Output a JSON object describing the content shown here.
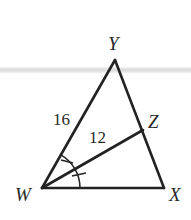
{
  "figure": {
    "type": "triangle-angle-bisector",
    "vertices": {
      "Y": {
        "label": "Y",
        "x": 115,
        "y": 60
      },
      "W": {
        "label": "W",
        "x": 42,
        "y": 188
      },
      "X": {
        "label": "X",
        "x": 164,
        "y": 188
      },
      "Z": {
        "label": "Z",
        "x": 143,
        "y": 130
      }
    },
    "segments": [
      {
        "from": "W",
        "to": "Y",
        "length_label": "16"
      },
      {
        "from": "Y",
        "to": "X",
        "length_label": ""
      },
      {
        "from": "W",
        "to": "X",
        "length_label": ""
      },
      {
        "from": "W",
        "to": "Z",
        "length_label": "12"
      }
    ],
    "angle_marks": {
      "vertex": "W",
      "description": "WZ bisects angle YWX; two congruent angle marks",
      "count": 2
    },
    "labels": {
      "Y": "Y",
      "W": "W",
      "X": "X",
      "Z": "Z",
      "WY": "16",
      "WZ": "12"
    },
    "colors": {
      "stroke": "#222222",
      "text": "#2a2a2a",
      "band": "#d9d9d9"
    }
  }
}
